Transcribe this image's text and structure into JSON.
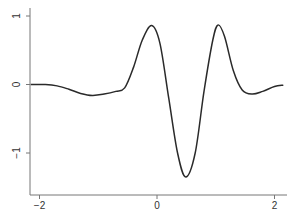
{
  "chart_data": {
    "type": "line",
    "title": "",
    "xlabel": "",
    "ylabel": "",
    "xlim": [
      -2.2,
      2.2
    ],
    "ylim": [
      -1.6,
      1.1
    ],
    "grid": false,
    "legend": null,
    "x_ticks": [
      -2,
      0,
      2
    ],
    "x_tick_labels": [
      "-2",
      "0",
      "2"
    ],
    "y_ticks": [
      -1,
      0,
      1
    ],
    "y_tick_labels": [
      "-1",
      "0",
      "1"
    ],
    "series": [
      {
        "name": "curve",
        "color": "#2a2a2a",
        "x": [
          -2.15,
          -1.9,
          -1.7,
          -1.5,
          -1.3,
          -1.1,
          -0.9,
          -0.7,
          -0.55,
          -0.4,
          -0.25,
          -0.09,
          0.05,
          0.2,
          0.35,
          0.49,
          0.65,
          0.8,
          0.95,
          1.04,
          1.15,
          1.3,
          1.45,
          1.62,
          1.8,
          2.0,
          2.15
        ],
        "y": [
          0.0,
          0.0,
          -0.02,
          -0.07,
          -0.13,
          -0.16,
          -0.14,
          -0.1,
          -0.05,
          0.25,
          0.65,
          0.86,
          0.6,
          -0.2,
          -1.0,
          -1.35,
          -1.0,
          -0.1,
          0.65,
          0.87,
          0.7,
          0.2,
          -0.08,
          -0.14,
          -0.1,
          -0.03,
          -0.01
        ]
      }
    ]
  }
}
